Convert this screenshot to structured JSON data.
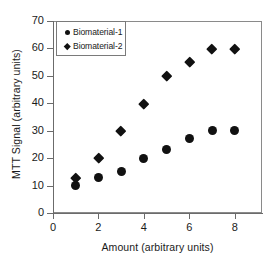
{
  "chart_data": {
    "type": "scatter",
    "title": "",
    "xlabel": "Amount (arbitrary units)",
    "ylabel": "MTT Signal (arbitrary units)",
    "xlim": [
      0,
      9.2
    ],
    "ylim": [
      0,
      70
    ],
    "xticks": [
      0,
      2,
      4,
      6,
      8
    ],
    "yticks": [
      0,
      10,
      20,
      30,
      40,
      50,
      60,
      70
    ],
    "grid": false,
    "legend_position": "top-left",
    "series": [
      {
        "name": "Biomaterial-1",
        "marker": "circle",
        "color": "#111111",
        "x": [
          1,
          2,
          3,
          4,
          5,
          6,
          7,
          8
        ],
        "y": [
          10,
          13,
          15,
          20,
          23,
          27,
          30,
          30
        ]
      },
      {
        "name": "Biomaterial-2",
        "marker": "diamond",
        "color": "#111111",
        "x": [
          1,
          2,
          3,
          4,
          5,
          6,
          7,
          8
        ],
        "y": [
          13,
          20,
          30,
          40,
          50,
          55,
          60,
          60
        ]
      }
    ]
  },
  "legend": {
    "items": [
      {
        "label": "Biomaterial-1",
        "marker": "circle"
      },
      {
        "label": "Biomaterial-2",
        "marker": "diamond"
      }
    ]
  },
  "axes": {
    "x_tick_labels": [
      "0",
      "2",
      "4",
      "6",
      "8"
    ],
    "y_tick_labels": [
      "0",
      "10",
      "20",
      "30",
      "40",
      "50",
      "60",
      "70"
    ]
  }
}
